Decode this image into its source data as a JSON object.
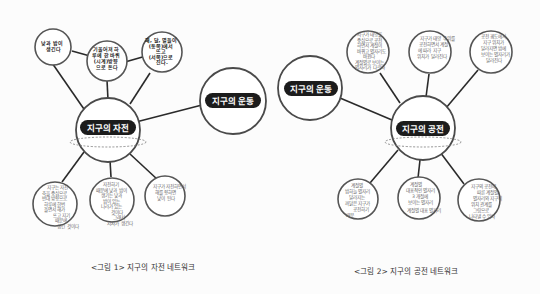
{
  "figure1": {
    "caption": "<그림 1> 지구의 자전 네트워크",
    "center": "지구의 자전",
    "link_node": "지구의 운동",
    "top_nodes": [
      {
        "lines": [
          "낮과 밤이",
          "생긴다"
        ]
      },
      {
        "lines": [
          "기울어져 하",
          "루에 한 바퀴",
          "(시계)방향",
          "으로 돈다"
        ]
      },
      {
        "lines": [
          "해, 달, 별들이",
          "(동쪽)에서",
          "뜨고",
          "(서쪽)으로",
          "진다."
        ]
      }
    ],
    "bottom_nodes": [
      {
        "lines": [
          "지구는 자전",
          "축을 중심으로",
          "반대 방향으로",
          "하루에 한번",
          "돌면서 해가",
          "뜨고 지기",
          "때문에",
          "생긴 것이다"
        ]
      },
      {
        "lines": [
          "자전하기",
          "때문에 낮과 밤이",
          "생기는 낮과",
          "밤이 있는",
          "나라가 있는",
          "것이다",
          "그래서",
          "시차가 생긴다"
        ]
      },
      {
        "lines": [
          "지구가 자전하면서",
          "해를 향하면",
          "낮이 된다"
        ]
      }
    ]
  },
  "figure2": {
    "caption": "<그림 2> 지구의 공전 네트워크",
    "center": "지구의 공전",
    "link_node": "지구의 운동",
    "top_nodes": [
      {
        "lines": [
          "지구가 태양을",
          "중심으로 공전",
          "하면서 계절이",
          "바뀌고 별자리도",
          "바뀐다",
          "계절별로 보이는",
          "별자리가 다르다"
        ]
      },
      {
        "lines": [
          "지구가 태양 주위를",
          "공전하면서 계절",
          "에 따라 지구",
          "위치가 달라진다"
        ]
      },
      {
        "lines": [
          "공전 궤도에서",
          "지구 위치가",
          "달라지면 밤에",
          "보이는 별자리가",
          "달라진다"
        ]
      }
    ],
    "bottom_nodes": [
      {
        "lines": [
          "계절별",
          "밤하늘 별자리",
          "달라지는",
          "까닭은 지구가",
          "공전하기",
          "때문"
        ]
      },
      {
        "lines": [
          "계절별",
          "대표적인 별자리",
          "3 개절에",
          "보이는 별자리",
          "계절별 대표 별자리"
        ]
      },
      {
        "lines": [
          "지구의 공전에",
          "따른 계절별",
          "별자리와 지구의",
          "위치 관계를",
          "그림으로",
          "나타낼 수 있다"
        ]
      }
    ]
  },
  "colors": {
    "pill": "#1c1c1c",
    "pill_text": "#ffffff",
    "line": "#2a2a2a",
    "handwriting": "#666666"
  }
}
